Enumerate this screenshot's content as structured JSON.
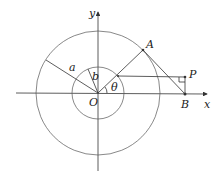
{
  "figure": {
    "type": "geometry-diagram",
    "labels": {
      "y_axis": "y",
      "x_axis": "x",
      "origin": "O",
      "point_A": "A",
      "point_B": "B",
      "point_P": "P",
      "outer_radius": "a",
      "inner_radius": "b",
      "angle": "θ"
    },
    "colors": {
      "lines": "#333333",
      "circles": "#555555",
      "text": "#222222"
    }
  }
}
